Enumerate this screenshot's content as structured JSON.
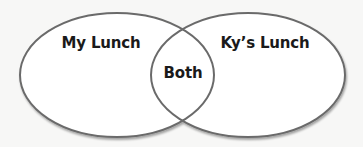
{
  "venn": {
    "left_set": {
      "label": "My Lunch"
    },
    "right_set": {
      "label": "Ky’s Lunch"
    },
    "intersection": {
      "label": "Both"
    }
  },
  "colors": {
    "background": "#f7f7f6",
    "stroke": "#6b6b6b",
    "fill": "#ffffff",
    "text": "#1a1a1a"
  }
}
